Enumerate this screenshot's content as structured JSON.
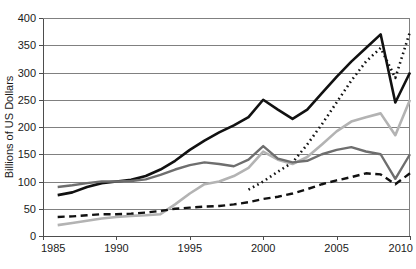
{
  "chart_data": {
    "type": "line",
    "title": "",
    "subtitle": "",
    "xlabel": "",
    "ylabel": "Billions of US Dollars",
    "xlim": [
      1985,
      2010
    ],
    "ylim": [
      0,
      400
    ],
    "xticks": [
      1985,
      1990,
      1995,
      2000,
      2005,
      2010
    ],
    "xtick_labels": [
      "1985",
      "1990",
      "1995",
      "2000",
      "2005",
      "2010"
    ],
    "yticks": [
      0,
      50,
      100,
      150,
      200,
      250,
      300,
      350,
      400
    ],
    "ytick_labels": [
      "0",
      "50",
      "100",
      "150",
      "200",
      "250",
      "300",
      "350",
      "400"
    ],
    "grid": true,
    "grid_axis": "y",
    "legend": false,
    "legend_position": "none",
    "annotations": [],
    "x": [
      1986,
      1987,
      1988,
      1989,
      1990,
      1991,
      1992,
      1993,
      1994,
      1995,
      1996,
      1997,
      1998,
      1999,
      2000,
      2001,
      2002,
      2003,
      2004,
      2005,
      2006,
      2007,
      2008,
      2009,
      2010
    ],
    "series": [
      {
        "name": "series-solid-black",
        "style": "solid",
        "color": "#111111",
        "width": 2.6,
        "values": [
          75,
          80,
          90,
          97,
          100,
          103,
          110,
          122,
          138,
          158,
          175,
          190,
          203,
          218,
          250,
          232,
          215,
          232,
          262,
          292,
          320,
          345,
          370,
          245,
          300
        ]
      },
      {
        "name": "series-dotted-black",
        "style": "dotted",
        "color": "#111111",
        "width": 2.6,
        "values": [
          null,
          null,
          null,
          null,
          null,
          null,
          null,
          null,
          null,
          null,
          null,
          null,
          null,
          85,
          100,
          118,
          135,
          168,
          205,
          245,
          285,
          320,
          345,
          290,
          375
        ]
      },
      {
        "name": "series-light-gray",
        "style": "solid",
        "color": "#b3b3b3",
        "width": 2.6,
        "values": [
          20,
          24,
          28,
          32,
          35,
          37,
          38,
          40,
          58,
          78,
          95,
          100,
          110,
          125,
          155,
          140,
          132,
          145,
          168,
          192,
          210,
          218,
          225,
          185,
          250
        ]
      },
      {
        "name": "series-dark-gray",
        "style": "solid",
        "color": "#6e6e6e",
        "width": 2.4,
        "values": [
          90,
          93,
          97,
          100,
          100,
          101,
          104,
          112,
          122,
          130,
          135,
          132,
          128,
          140,
          165,
          142,
          135,
          138,
          150,
          158,
          163,
          155,
          150,
          105,
          150
        ]
      },
      {
        "name": "series-dashed-black",
        "style": "dashed",
        "color": "#111111",
        "width": 2.4,
        "values": [
          35,
          36,
          38,
          40,
          40,
          41,
          43,
          46,
          50,
          52,
          54,
          55,
          58,
          62,
          68,
          72,
          78,
          86,
          95,
          102,
          108,
          115,
          113,
          95,
          115
        ]
      }
    ]
  },
  "axis": {
    "y_title": "Billions of US Dollars"
  }
}
